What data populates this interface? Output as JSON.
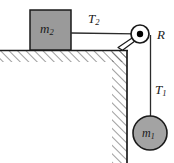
{
  "figure": {
    "kind": "physics-free-body-diagram",
    "width": 174,
    "height": 163,
    "background_color": "#ffffff"
  },
  "colors": {
    "stroke": "#1a1a1a",
    "block_fill": "#9a9a9a",
    "mass_fill": "#a3a3a3",
    "hatch_stroke": "#4d4d4d",
    "surface_line": "#1a1a1a",
    "rope": "#2b2b2b",
    "pulley_fill": "#ffffff",
    "axle_fill": "#000000"
  },
  "labels": {
    "block_on_table": {
      "base": "m",
      "sub": "2",
      "text": "m2"
    },
    "hanging_mass": {
      "base": "m",
      "sub": "1",
      "text": "m1"
    },
    "tension_horizontal": {
      "base": "T",
      "sub": "2",
      "text": "T2"
    },
    "tension_vertical": {
      "base": "T",
      "sub": "1",
      "text": "T1"
    },
    "pulley_radius": {
      "base": "R",
      "sub": "",
      "text": "R"
    }
  },
  "geometry": {
    "table_surface_y": 50,
    "table_left_x": 0,
    "table_corner_x": 127,
    "wall_x": 127,
    "wall_bottom_y": 163,
    "block": {
      "x": 30,
      "y": 10,
      "width": 41,
      "height": 40
    },
    "rope_horizontal": {
      "x1": 71,
      "y1": 33,
      "x2": 134,
      "y2": 33
    },
    "rope_vertical": {
      "x1": 151,
      "y1": 35,
      "x2": 151,
      "y2": 116
    },
    "pulley": {
      "cx": 140,
      "cy": 34,
      "r": 9,
      "axle_r": 3.2
    },
    "hanging_mass": {
      "cx": 150,
      "cy": 133,
      "r": 17
    }
  }
}
